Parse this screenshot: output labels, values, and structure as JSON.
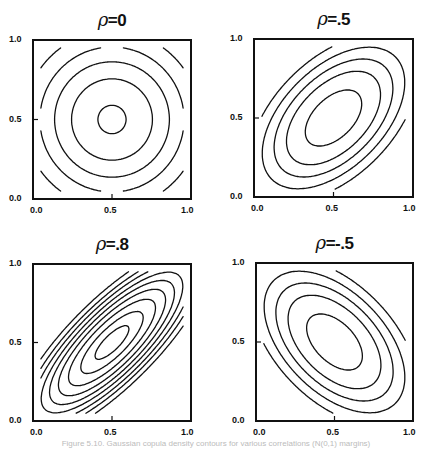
{
  "figure": {
    "caption": "Figure 5.10. Gaussian copula density contours for various correlations (N(0,1) margins)"
  },
  "chart_data": [
    {
      "type": "contour",
      "title": "ρ=0",
      "rho": 0,
      "xlabel": "",
      "ylabel": "",
      "xlim": [
        0,
        1
      ],
      "ylim": [
        0,
        1
      ],
      "xticks": [
        "0.0",
        "0.5",
        "1.0"
      ],
      "yticks": [
        "0.0",
        "0.5",
        "1.0"
      ],
      "levels": [
        0.985,
        0.95,
        0.9,
        0.8,
        0.7
      ],
      "note": "copula density contours; concentric squarish rings centered at (0.5, 0.5)"
    },
    {
      "type": "contour",
      "title": "ρ=.5",
      "rho": 0.5,
      "xlim": [
        0,
        1
      ],
      "ylim": [
        0,
        1
      ],
      "xticks": [
        "0.0",
        "0.5",
        "1.0"
      ],
      "yticks": [
        "0.0",
        "0.5",
        "1.0"
      ],
      "levels": [
        0.92,
        0.9,
        0.87,
        0.83,
        0.75
      ],
      "note": "elongated along main diagonal"
    },
    {
      "type": "contour",
      "title": "ρ=.8",
      "rho": 0.8,
      "xlim": [
        0,
        1
      ],
      "ylim": [
        0,
        1
      ],
      "xticks": [
        "0.0",
        "0.5",
        "1.0"
      ],
      "yticks": [
        "0.0",
        "0.5",
        "1.0"
      ],
      "levels": [
        1.0,
        0.95,
        0.9,
        0.85,
        0.8,
        0.75,
        0.7,
        0.65,
        0.6
      ],
      "note": "narrow lens shapes along main diagonal"
    },
    {
      "type": "contour",
      "title": "ρ=-.5",
      "rho": -0.5,
      "xlim": [
        0,
        1
      ],
      "ylim": [
        0,
        1
      ],
      "xticks": [
        "0.0",
        "0.5",
        "1.0"
      ],
      "yticks": [
        "0.0",
        "0.5",
        "1.0"
      ],
      "levels": [
        0.92,
        0.9,
        0.87,
        0.83,
        0.75
      ],
      "note": "elongated along anti-diagonal"
    }
  ],
  "panels": [
    {
      "title_rho": "ρ",
      "title_val": "=0",
      "x": 33,
      "y": 40,
      "w": 158,
      "h": 159
    },
    {
      "title_rho": "ρ",
      "title_val": "=.5",
      "x": 254,
      "y": 39,
      "w": 159,
      "h": 158
    },
    {
      "title_rho": "ρ",
      "title_val": "=.8",
      "x": 33,
      "y": 264,
      "w": 158,
      "h": 157
    },
    {
      "title_rho": "ρ",
      "title_val": "=-.5",
      "x": 256,
      "y": 263,
      "w": 157,
      "h": 158
    }
  ],
  "ticks": {
    "y_top": "1.0",
    "y_mid": "0.5",
    "y_bot": "0.0",
    "x_left": "0.0",
    "x_mid": "0.5",
    "x_right": "1.0"
  }
}
